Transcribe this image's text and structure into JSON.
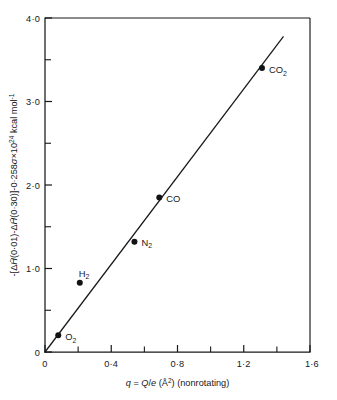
{
  "chart_data": {
    "type": "scatter",
    "title": "",
    "subtitle": "",
    "xlabel": "q = Q/e (Å²) (nonrotating)",
    "ylabel": "-[ΔH̄(0·01)-ΔH̄(0·30)]-0·258σ×10²⁴ kcal mol⁻¹",
    "xlim": [
      0,
      1.6
    ],
    "ylim": [
      0,
      4.0
    ],
    "grid": false,
    "legend": "none",
    "x_ticks_major": [
      "0",
      "0·4",
      "0·8",
      "1·2",
      "1·6"
    ],
    "x_ticks_major_values": [
      0,
      0.4,
      0.8,
      1.2,
      1.6
    ],
    "x_ticks_minor_values": [
      0.2,
      0.6,
      1.0,
      1.4
    ],
    "y_ticks_major": [
      "0",
      "1·0",
      "2·0",
      "3·0",
      "4·0"
    ],
    "y_ticks_major_values": [
      0,
      1.0,
      2.0,
      3.0,
      4.0
    ],
    "y_ticks_minor_values": [
      0.5,
      1.5,
      2.5,
      3.5
    ],
    "points": [
      {
        "label": "O2",
        "label_main": "O",
        "label_sub": "2",
        "x": 0.08,
        "y": 0.2
      },
      {
        "label": "H2",
        "label_main": "H",
        "label_sub": "2",
        "x": 0.21,
        "y": 0.83
      },
      {
        "label": "N2",
        "label_main": "N",
        "label_sub": "2",
        "x": 0.54,
        "y": 1.32
      },
      {
        "label": "CO",
        "label_main": "CO",
        "label_sub": "",
        "x": 0.69,
        "y": 1.85
      },
      {
        "label": "CO2",
        "label_main": "CO",
        "label_sub": "2",
        "x": 1.31,
        "y": 3.4
      }
    ],
    "fit_line": {
      "x0": 0.0,
      "y0": 0.0,
      "x1": 1.44,
      "y1": 3.78
    },
    "series": [
      {
        "name": "molecules",
        "x": [
          0.08,
          0.21,
          0.54,
          0.69,
          1.31
        ],
        "values": [
          0.2,
          0.83,
          1.32,
          1.85,
          3.4
        ]
      }
    ]
  },
  "ylabel_parts": {
    "lead": "-[Δ",
    "h1": "H",
    "arg1": "(0·01)-Δ",
    "h2": "H",
    "arg2": "(0·30)]-0·258",
    "sigma": "σ",
    "times": "×10",
    "exp": "24",
    "unit": " kcal mol",
    "unit_exp": "-1"
  },
  "xlabel_parts": {
    "q": "q",
    "eq": " = ",
    "Q": "Q",
    "slash": "/",
    "e": "e",
    "paren_open": " (Å",
    "exp": "2",
    "paren_close": ") (nonrotating)"
  }
}
